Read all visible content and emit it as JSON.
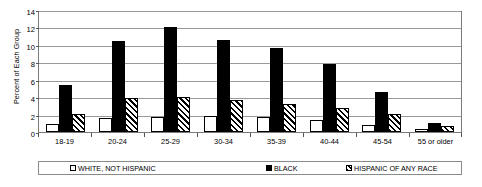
{
  "chart_data": {
    "type": "bar",
    "title": "",
    "xlabel": "",
    "ylabel": "Percent of Each Group",
    "ylim": [
      0,
      14
    ],
    "yticks": [
      0,
      2,
      4,
      6,
      8,
      10,
      12,
      14
    ],
    "grid": true,
    "legend_position": "bottom",
    "categories": [
      "18-19",
      "20-24",
      "25-29",
      "30-34",
      "35-39",
      "40-44",
      "45-54",
      "55 or older"
    ],
    "series": [
      {
        "name": "WHITE, NOT HISPANIC",
        "style": "hollow",
        "values": [
          0.9,
          1.6,
          1.75,
          1.8,
          1.75,
          1.4,
          0.8,
          0.3
        ]
      },
      {
        "name": "BLACK",
        "style": "solid-black",
        "values": [
          5.4,
          10.5,
          12.0,
          10.6,
          9.6,
          7.8,
          4.6,
          1.0
        ]
      },
      {
        "name": "HISPANIC OF ANY RACE",
        "style": "diagonal-hatch",
        "values": [
          2.1,
          3.9,
          4.0,
          3.7,
          3.2,
          2.8,
          2.1,
          0.65
        ]
      }
    ]
  },
  "legend": {
    "items": [
      {
        "label": "WHITE, NOT HISPANIC",
        "style": "white"
      },
      {
        "label": "BLACK",
        "style": "black"
      },
      {
        "label": "HISPANIC OF ANY RACE",
        "style": "hisp"
      }
    ]
  }
}
